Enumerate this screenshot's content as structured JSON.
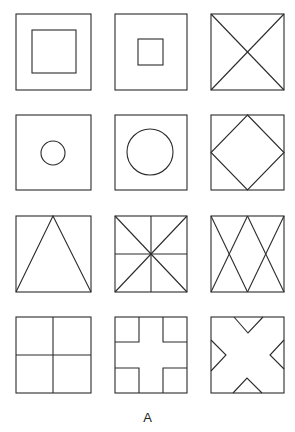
{
  "figure": {
    "caption": "A",
    "grid": {
      "rows": 4,
      "cols": 3
    },
    "stroke_color": "#2b2b2b",
    "background": "#ffffff",
    "panels": [
      {
        "row": 1,
        "col": 1,
        "description": "square with large inner square"
      },
      {
        "row": 1,
        "col": 2,
        "description": "square with small inner square"
      },
      {
        "row": 1,
        "col": 3,
        "description": "square with two diagonals (X)"
      },
      {
        "row": 2,
        "col": 1,
        "description": "square with small inner circle"
      },
      {
        "row": 2,
        "col": 2,
        "description": "square with large inner circle"
      },
      {
        "row": 2,
        "col": 3,
        "description": "square with inscribed diamond"
      },
      {
        "row": 3,
        "col": 1,
        "description": "square with inscribed triangle"
      },
      {
        "row": 3,
        "col": 2,
        "description": "square with diagonals, vertical and horizontal midlines"
      },
      {
        "row": 3,
        "col": 3,
        "description": "square with double-X (two overlapping V crossings)"
      },
      {
        "row": 4,
        "col": 1,
        "description": "square divided into four quadrants"
      },
      {
        "row": 4,
        "col": 2,
        "description": "square with plus-shaped cross cut-out"
      },
      {
        "row": 4,
        "col": 3,
        "description": "square with X-shape formed by four triangular notches"
      }
    ]
  }
}
